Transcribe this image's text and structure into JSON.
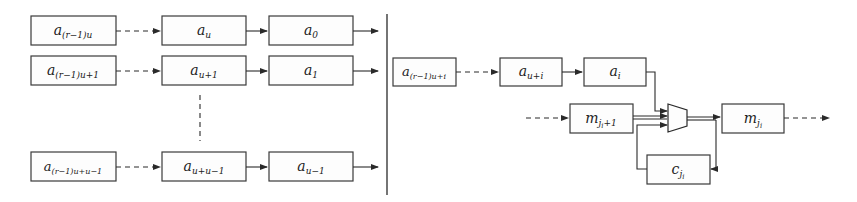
{
  "diagram": {
    "left_panel": {
      "rows": [
        {
          "boxes": [
            {
              "base": "a",
              "sub": "(r−1)u"
            },
            {
              "base": "a",
              "sub": "u"
            },
            {
              "base": "a",
              "sub": "0"
            }
          ]
        },
        {
          "boxes": [
            {
              "base": "a",
              "sub": "(r−1)u+1"
            },
            {
              "base": "a",
              "sub": "u+1"
            },
            {
              "base": "a",
              "sub": "1"
            }
          ]
        },
        {
          "boxes": [
            {
              "base": "a",
              "sub": "(r−1)u+u−1"
            },
            {
              "base": "a",
              "sub": "u+u−1"
            },
            {
              "base": "a",
              "sub": "u−1"
            }
          ]
        }
      ]
    },
    "right_panel": {
      "shift_chain": [
        {
          "base": "a",
          "sub": "(r−1)u+i"
        },
        {
          "base": "a",
          "sub": "u+i"
        },
        {
          "base": "a",
          "sub": "i"
        }
      ],
      "m_next": {
        "base": "m",
        "sub": "j",
        "subsub": "i",
        "tail": "+1"
      },
      "m_current": {
        "base": "m",
        "sub": "j",
        "subsub": "i"
      },
      "c_register": {
        "base": "c",
        "sub": "j",
        "subsub": "i"
      },
      "mux": "multiplexer"
    },
    "colors": {
      "stroke": "#2a2a2a",
      "box_fill": "#fdfdfd",
      "background": "#ffffff"
    }
  }
}
